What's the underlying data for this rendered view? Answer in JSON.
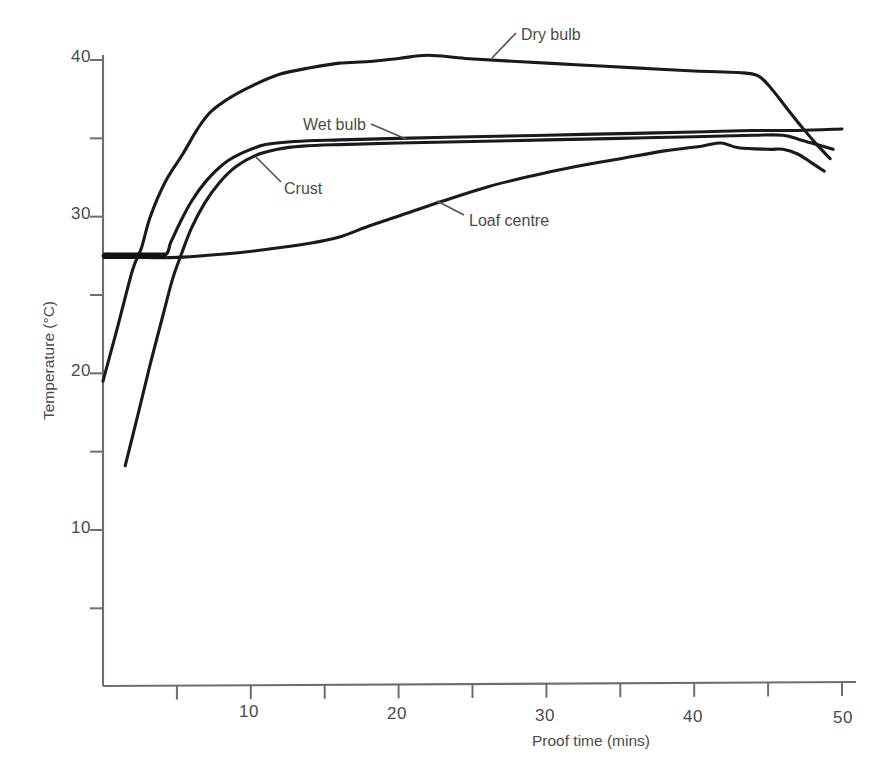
{
  "chart_data": {
    "type": "line",
    "title": "",
    "xlabel": "Proof time (mins)",
    "ylabel": "Temperature (°C)",
    "xlim": [
      0,
      50
    ],
    "ylim": [
      0,
      42
    ],
    "grid": false,
    "legend_position": "inline-annotations",
    "x_ticks_major": [
      10,
      20,
      30,
      40,
      50
    ],
    "x_ticks_minor": [
      5,
      15,
      25,
      35,
      45
    ],
    "y_ticks_major": [
      10,
      20,
      30,
      40
    ],
    "y_ticks_minor": [
      5,
      15,
      25,
      35
    ],
    "x_tick_labels": [
      "10",
      "20",
      "30",
      "40",
      "50"
    ],
    "y_tick_labels": [
      "10",
      "20",
      "30",
      "40"
    ],
    "series": [
      {
        "name": "Dry bulb",
        "label": "Dry bulb",
        "color": "#1a1a1a",
        "points": [
          [
            0.0,
            19.5
          ],
          [
            1.0,
            23.0
          ],
          [
            2.0,
            26.6
          ],
          [
            2.6,
            28.0
          ],
          [
            3.2,
            30.0
          ],
          [
            4.2,
            32.2
          ],
          [
            5.4,
            34.0
          ],
          [
            6.4,
            35.6
          ],
          [
            7.3,
            36.7
          ],
          [
            8.6,
            37.6
          ],
          [
            10.2,
            38.4
          ],
          [
            12.0,
            39.1
          ],
          [
            14.0,
            39.5
          ],
          [
            16.0,
            39.8
          ],
          [
            18.0,
            39.9
          ],
          [
            20.0,
            40.1
          ],
          [
            22.0,
            40.3
          ],
          [
            24.5,
            40.1
          ],
          [
            28.0,
            39.9
          ],
          [
            32.0,
            39.7
          ],
          [
            36.0,
            39.5
          ],
          [
            40.0,
            39.3
          ],
          [
            43.0,
            39.2
          ],
          [
            44.3,
            39.0
          ],
          [
            45.2,
            38.2
          ],
          [
            46.2,
            37.0
          ],
          [
            47.3,
            35.7
          ],
          [
            48.3,
            34.6
          ],
          [
            49.2,
            33.7
          ]
        ]
      },
      {
        "name": "Wet bulb",
        "label": "Wet bulb",
        "color": "#1a1a1a",
        "points": [
          [
            0.0,
            27.5
          ],
          [
            2.0,
            27.5
          ],
          [
            4.1,
            27.5
          ],
          [
            4.6,
            28.4
          ],
          [
            5.2,
            29.6
          ],
          [
            6.0,
            31.0
          ],
          [
            7.0,
            32.3
          ],
          [
            8.2,
            33.4
          ],
          [
            9.5,
            34.1
          ],
          [
            11.0,
            34.6
          ],
          [
            13.0,
            34.8
          ],
          [
            16.0,
            34.9
          ],
          [
            20.0,
            35.0
          ],
          [
            25.0,
            35.1
          ],
          [
            30.0,
            35.2
          ],
          [
            35.0,
            35.3
          ],
          [
            40.0,
            35.4
          ],
          [
            44.0,
            35.5
          ],
          [
            47.0,
            35.5
          ],
          [
            50.0,
            35.6
          ]
        ]
      },
      {
        "name": "Crust",
        "label": "Crust",
        "color": "#1a1a1a",
        "points": [
          [
            1.5,
            14.1
          ],
          [
            2.4,
            17.5
          ],
          [
            3.2,
            20.6
          ],
          [
            4.0,
            23.5
          ],
          [
            4.7,
            26.0
          ],
          [
            5.3,
            27.6
          ],
          [
            6.0,
            29.3
          ],
          [
            6.9,
            30.9
          ],
          [
            7.9,
            32.2
          ],
          [
            9.0,
            33.2
          ],
          [
            10.3,
            33.9
          ],
          [
            11.8,
            34.3
          ],
          [
            13.5,
            34.5
          ],
          [
            16.0,
            34.6
          ],
          [
            20.0,
            34.7
          ],
          [
            25.0,
            34.8
          ],
          [
            30.0,
            34.9
          ],
          [
            35.0,
            35.0
          ],
          [
            40.0,
            35.1
          ],
          [
            44.0,
            35.2
          ],
          [
            46.0,
            35.2
          ],
          [
            47.2,
            34.9
          ],
          [
            48.3,
            34.6
          ],
          [
            49.4,
            34.3
          ]
        ]
      },
      {
        "name": "Loaf centre",
        "label": "Loaf centre",
        "color": "#1a1a1a",
        "points": [
          [
            0.3,
            27.6
          ],
          [
            3.0,
            27.4
          ],
          [
            5.0,
            27.4
          ],
          [
            8.0,
            27.6
          ],
          [
            11.0,
            27.9
          ],
          [
            14.0,
            28.3
          ],
          [
            16.0,
            28.7
          ],
          [
            18.0,
            29.4
          ],
          [
            20.5,
            30.2
          ],
          [
            23.0,
            31.0
          ],
          [
            26.0,
            31.9
          ],
          [
            29.0,
            32.6
          ],
          [
            32.0,
            33.2
          ],
          [
            35.0,
            33.7
          ],
          [
            38.0,
            34.2
          ],
          [
            40.5,
            34.5
          ],
          [
            41.8,
            34.7
          ],
          [
            43.0,
            34.4
          ],
          [
            45.0,
            34.3
          ],
          [
            46.0,
            34.3
          ],
          [
            47.0,
            34.0
          ],
          [
            48.0,
            33.4
          ],
          [
            48.8,
            32.9
          ]
        ]
      }
    ],
    "annotations": [
      {
        "name": "Dry bulb",
        "text": "Dry bulb",
        "text_x": 521,
        "text_y": 26
      },
      {
        "name": "Wet bulb",
        "text": "Wet bulb",
        "text_x": 303,
        "text_y": 116
      },
      {
        "name": "Crust",
        "text": "Crust",
        "text_x": 282,
        "text_y": 180
      },
      {
        "name": "Loaf centre",
        "text": "Loaf centre",
        "text_x": 469,
        "text_y": 212
      }
    ]
  },
  "axes": {
    "x_title": "Proof time (mins)",
    "y_title": "Temperature (°C)"
  }
}
